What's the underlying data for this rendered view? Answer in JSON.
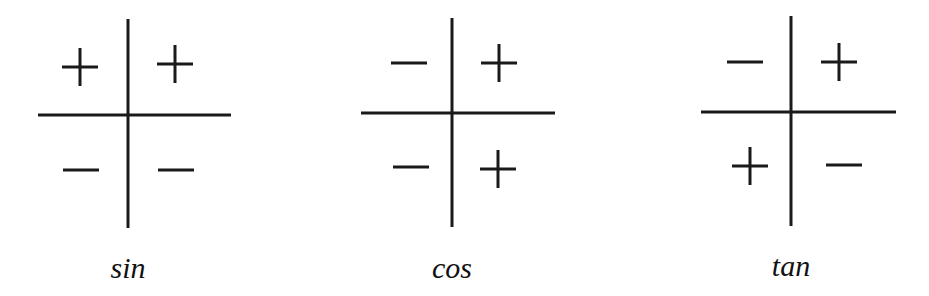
{
  "diagrams": [
    {
      "name": "sin",
      "label": "sin",
      "signs": {
        "q2": "-",
        "q1": "+",
        "q3": "-",
        "q4": "-"
      },
      "quadrants": {
        "top_left": "+",
        "top_right": "+",
        "bottom_left": "−",
        "bottom_right": "−"
      }
    },
    {
      "name": "cos",
      "label": "cos",
      "quadrants": {
        "top_left": "−",
        "top_right": "+",
        "bottom_left": "−",
        "bottom_right": "+"
      }
    },
    {
      "name": "tan",
      "label": "tan",
      "quadrants": {
        "top_left": "−",
        "top_right": "+",
        "bottom_left": "+",
        "bottom_right": "−"
      }
    }
  ],
  "colors": {
    "ink": "#1a1a1a",
    "background": "#ffffff"
  }
}
